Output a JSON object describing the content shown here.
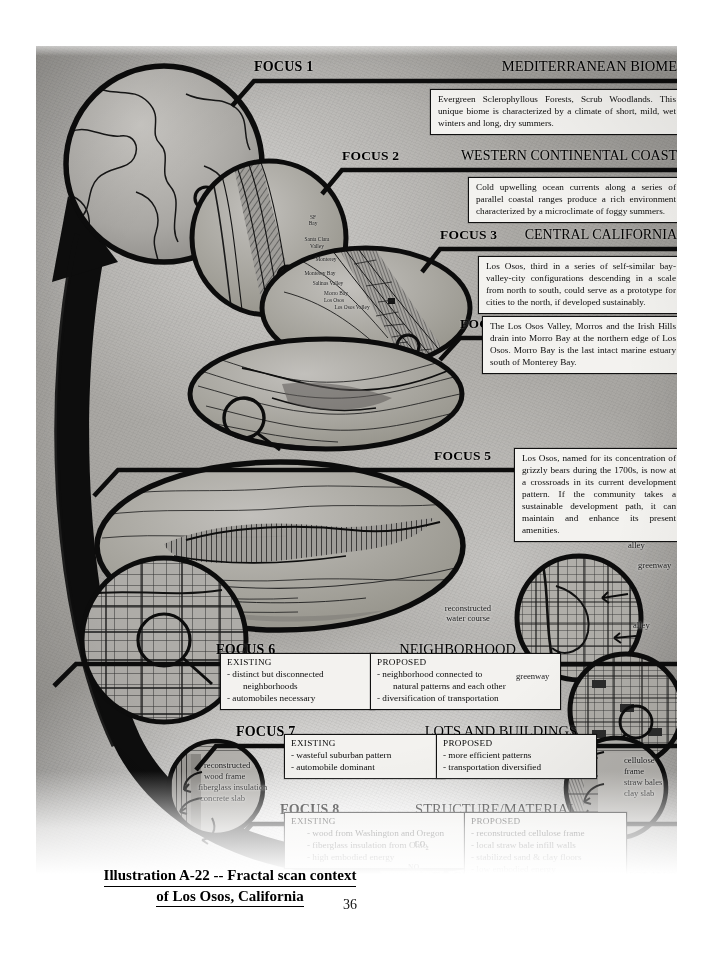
{
  "caption": {
    "line1": "Illustration A-22 -- Fractal scan context",
    "line2": "of Los Osos, California",
    "page_number": "36"
  },
  "focuses": [
    {
      "number": "FOCUS 1",
      "title": "MEDITERRANEAN BIOME",
      "body": "Evergreen Sclerophyllous Forests, Scrub Woodlands.  This unique biome is characterized by a climate of short, mild, wet winters and long, dry summers."
    },
    {
      "number": "FOCUS 2",
      "title": "WESTERN CONTINENTAL COAST",
      "body": "Cold upwelling ocean currents along a series of parallel coastal ranges produce a rich environment characterized by a microclimate of foggy summers."
    },
    {
      "number": "FOCUS 3",
      "title": "CENTRAL CALIFORNIA",
      "body": "Los Osos, third in a series of self-similar bay-valley-city configurations descending in a scale from north to south, could serve as a prototype for cities to the north, if developed sustainably."
    },
    {
      "number": "FOCUS 4",
      "title": "WATERSHED",
      "body": "The Los Osos Valley, Morros and the Irish Hills drain into Morro Bay at the northern edge of Los Osos.  Morro Bay is the last intact marine estuary south of Monterey Bay."
    },
    {
      "number": "FOCUS 5",
      "title": "LOS OSOS",
      "body": "Los Osos, named for its concentration of grizzly bears during the 1700s, is now at a crossroads in its current development pattern.   If the community takes a sustainable development path, it can maintain and enhance its present amenities."
    },
    {
      "number": "FOCUS 6",
      "title": "NEIGHBORHOOD",
      "existing_heading": "EXISTING",
      "existing_items": [
        "- distinct but disconnected",
        "neighborhoods",
        "- automobiles necessary"
      ],
      "proposed_heading": "PROPOSED",
      "proposed_items": [
        "- neighborhood connected to",
        "natural patterns and each other",
        "-  diversification of transportation"
      ]
    },
    {
      "number": "FOCUS 7",
      "title": "LOTS AND BUILDINGS",
      "existing_heading": "EXISTING",
      "existing_items": [
        "- wasteful suburban pattern",
        "- automobile dominant"
      ],
      "proposed_heading": "PROPOSED",
      "proposed_items": [
        "- more efficient patterns",
        "- transportation diversified"
      ]
    },
    {
      "number": "FOCUS 8",
      "title": "STRUCTURE/MATERIAL",
      "existing_heading": "EXISTING",
      "existing_items": [
        "- wood from Washington and Oregon",
        "- fiberglass insulation from Ohio",
        "- high embodied energy"
      ],
      "proposed_heading": "PROPOSED",
      "proposed_items": [
        "- reconstructed cellulose frame",
        "- local straw bale infill walls",
        "- stabilized sand & clay floors",
        "- low embodied energy"
      ]
    },
    {
      "number": "FOCUS 9",
      "title": "DECAY & RECYCLING"
    }
  ],
  "annotations": {
    "alley_top": "alley",
    "greenway_top": "greenway",
    "alley_mid": "alley",
    "greenway_left": "greenway",
    "water_course_1": "reconstructed",
    "water_course_2": "water course",
    "existing_wall_1": "reconstructed",
    "existing_wall_2": "wood frame",
    "existing_wall_3": "fiberglass insulation",
    "existing_wall_4": "concrete slab",
    "proposed_wall_1": "cellulose",
    "proposed_wall_2": "frame",
    "proposed_wall_3": "straw bales",
    "proposed_wall_4": "clay slab",
    "co2": "CO",
    "co2_sub": "2",
    "nox": "NO",
    "nox_sub": "x"
  },
  "map_labels": [
    {
      "text": "SF",
      "x": 313,
      "y": 214
    },
    {
      "text": "Bay",
      "x": 313,
      "y": 220
    },
    {
      "text": "Santa Clara",
      "x": 317,
      "y": 236
    },
    {
      "text": "Valley",
      "x": 317,
      "y": 243
    },
    {
      "text": "Monterey",
      "x": 326,
      "y": 256
    },
    {
      "text": "Monterey Bay",
      "x": 320,
      "y": 270
    },
    {
      "text": "Salinas Valley",
      "x": 328,
      "y": 280
    },
    {
      "text": "Morro Bay",
      "x": 336,
      "y": 290
    },
    {
      "text": "Los Osos",
      "x": 334,
      "y": 297
    },
    {
      "text": "Los Osos Valley",
      "x": 352,
      "y": 304
    }
  ],
  "colors": {
    "ink": "#0c0c0c",
    "paper": "#a8a6a2",
    "box_fill": "#f3f2ef"
  }
}
